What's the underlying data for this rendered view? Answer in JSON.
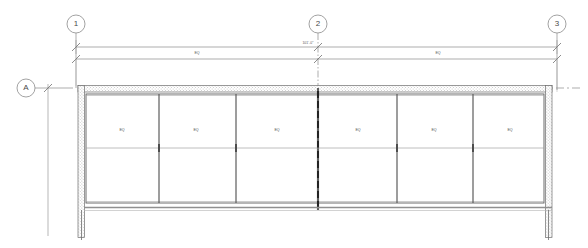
{
  "drawing": {
    "type": "architectural-plan-detail",
    "description": "Partial floor plan of a storefront / curtain wall assembly with six equal glazed bays",
    "paper_color": "#ffffff",
    "line_color": "#6e6e6e",
    "heavy_line_color": "#2b2b2b",
    "hatch_color": "#8a8a8a"
  },
  "grid_bubbles": {
    "top": [
      {
        "label": "1",
        "cx": 76,
        "cy": 24,
        "r": 9
      },
      {
        "label": "2",
        "cx": 318,
        "cy": 24,
        "r": 9
      },
      {
        "label": "3",
        "cx": 557,
        "cy": 24,
        "r": 9
      }
    ],
    "left": [
      {
        "label": "A",
        "cx": 26,
        "cy": 88,
        "r": 9
      }
    ]
  },
  "dimensions": {
    "overall": {
      "text": "101'-0\"",
      "x": 308,
      "y": 44,
      "from_grid": "1",
      "to_grid": "3"
    },
    "strings": [
      {
        "text": "EQ",
        "x": 197,
        "y": 54,
        "from_grid": "1",
        "to_grid": "2"
      },
      {
        "text": "EQ",
        "x": 438,
        "y": 54,
        "from_grid": "2",
        "to_grid": "3"
      }
    ]
  },
  "panels": {
    "label": "EQ",
    "count": 6,
    "items": [
      {
        "label": "EQ",
        "cx": 122,
        "cy": 131
      },
      {
        "label": "EQ",
        "cx": 196,
        "cy": 131
      },
      {
        "label": "EQ",
        "cx": 277,
        "cy": 131
      },
      {
        "label": "EQ",
        "cx": 358,
        "cy": 131
      },
      {
        "label": "EQ",
        "cx": 434,
        "cy": 131
      },
      {
        "label": "EQ",
        "cx": 510,
        "cy": 131
      }
    ]
  },
  "geometry": {
    "wall_top_y": 86,
    "wall_thickness": 6,
    "wall_left_x": 78,
    "wall_right_x": 552,
    "glazing_bottom_y": 203,
    "mullion_x": [
      159,
      236,
      318,
      397,
      473
    ],
    "center_mullion_x": 318,
    "horizontal_rail_y": 148,
    "bottom_return_y": 210
  }
}
